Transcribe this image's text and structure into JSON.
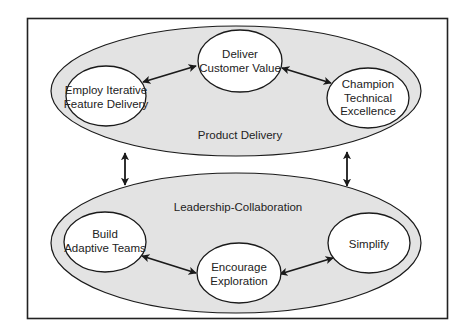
{
  "diagram": {
    "colors": {
      "frame_stroke": "#222222",
      "group_fill": "#e3e3e3",
      "node_fill": "#ffffff",
      "stroke": "#1a1a1a",
      "text": "#222222"
    },
    "groups": [
      {
        "id": "product-delivery",
        "label": "Product Delivery"
      },
      {
        "id": "leadership-collaboration",
        "label": "Leadership-Collaboration"
      }
    ],
    "nodes": [
      {
        "id": "deliver-customer-value",
        "group": "product-delivery",
        "lines": [
          "Deliver",
          "Customer Value"
        ]
      },
      {
        "id": "employ-iterative-feature-delivery",
        "group": "product-delivery",
        "lines": [
          "Employ Iterative",
          "Feature Delivery"
        ]
      },
      {
        "id": "champion-technical-excellence",
        "group": "product-delivery",
        "lines": [
          "Champion",
          "Technical",
          "Excellence"
        ]
      },
      {
        "id": "build-adaptive-teams",
        "group": "leadership-collaboration",
        "lines": [
          "Build",
          "Adaptive Teams"
        ]
      },
      {
        "id": "encourage-exploration",
        "group": "leadership-collaboration",
        "lines": [
          "Encourage",
          "Exploration"
        ]
      },
      {
        "id": "simplify",
        "group": "leadership-collaboration",
        "lines": [
          "Simplify"
        ]
      }
    ],
    "edges": [
      {
        "from": "employ-iterative-feature-delivery",
        "to": "deliver-customer-value",
        "type": "bidirectional"
      },
      {
        "from": "deliver-customer-value",
        "to": "champion-technical-excellence",
        "type": "bidirectional"
      },
      {
        "from": "build-adaptive-teams",
        "to": "encourage-exploration",
        "type": "bidirectional"
      },
      {
        "from": "encourage-exploration",
        "to": "simplify",
        "type": "bidirectional"
      },
      {
        "from": "product-delivery",
        "to": "leadership-collaboration",
        "type": "bidirectional",
        "position": "left"
      },
      {
        "from": "product-delivery",
        "to": "leadership-collaboration",
        "type": "bidirectional",
        "position": "right"
      }
    ]
  }
}
